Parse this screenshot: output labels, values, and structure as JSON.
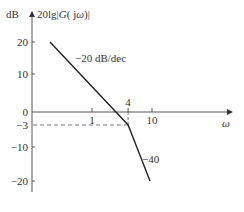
{
  "chart_data": {
    "type": "line",
    "title": "",
    "ylabel_unit": "dB",
    "ylabel": "20lg|G(jω)|",
    "xlabel": "ω",
    "xscale": "log",
    "yticks": [
      20,
      10,
      0,
      -3,
      -10,
      -20
    ],
    "ytick_labels": [
      "20",
      "10",
      "0",
      "−3",
      "−10",
      "−20"
    ],
    "xticks": [
      1,
      4,
      10
    ],
    "xtick_labels": [
      "1",
      "4",
      "10"
    ],
    "ylim": [
      -25,
      25
    ],
    "series": [
      {
        "name": "asymptote",
        "points": [
          [
            0.1,
            20
          ],
          [
            4,
            -3
          ],
          [
            12,
            -20
          ]
        ]
      }
    ],
    "reference_lines": [
      {
        "type": "horizontal-dashed",
        "y": -3,
        "x_from": 0.06,
        "x_to": 4
      },
      {
        "type": "vertical-dashed",
        "x": 4,
        "y_from": 0,
        "y_to": -3
      }
    ],
    "annotations": [
      {
        "text": "−20 dB/dec",
        "segment": "first"
      },
      {
        "text": "−40",
        "segment": "second"
      },
      {
        "text": "4",
        "at_x": 4
      }
    ],
    "grid": false,
    "legend": "none"
  }
}
